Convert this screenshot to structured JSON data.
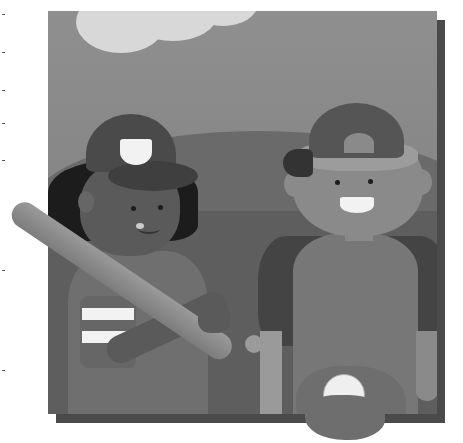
{
  "image": {
    "description": "Illustration of two children in baseball caps; girl holding a baseball bat on shoulder, boy holding a baseball in a glove",
    "style": "grayscale flat illustration with drop shadow",
    "colors": {
      "sky": "#8f8f8f",
      "cloud": "#d8d8d8",
      "hills": "#6a6a6a",
      "frame_shadow": "#4a4a4a",
      "background": "#ffffff"
    },
    "figures": [
      {
        "name": "girl",
        "props": [
          "cap",
          "baseball-bat",
          "striped-sleeve"
        ]
      },
      {
        "name": "boy",
        "props": [
          "backwards-cap",
          "baseball-glove",
          "baseball"
        ]
      }
    ]
  }
}
